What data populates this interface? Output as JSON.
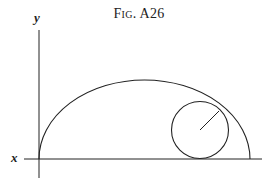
{
  "figure": {
    "title": "Fig. A26",
    "axis_labels": {
      "x": "x",
      "y": "y"
    },
    "line_color": "#222222",
    "elements": {
      "x_axis": {
        "x1": 24,
        "y1": 159,
        "x2": 262,
        "y2": 159
      },
      "y_axis": {
        "x1": 39,
        "y1": 30,
        "x2": 39,
        "y2": 178
      },
      "large_arc": {
        "start": [
          39,
          159
        ],
        "end": [
          250,
          159
        ],
        "rx": 105.5,
        "ry": 79,
        "shape": "semi-ellipse"
      },
      "small_circle": {
        "cx": 200,
        "cy": 130,
        "r": 28.5
      },
      "radius_line": {
        "x1": 200,
        "y1": 130,
        "x2": 219,
        "y2": 111
      }
    }
  }
}
